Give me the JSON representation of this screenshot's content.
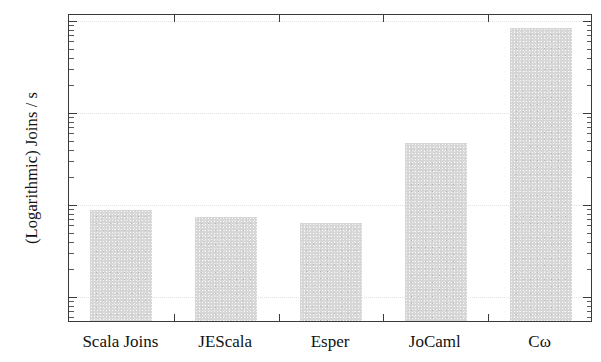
{
  "chart_data": {
    "type": "bar",
    "title": "",
    "xlabel": "",
    "ylabel": "(Logarithmic) Joins / s",
    "yscale": "log",
    "ylim": [
      5000,
      10000000
    ],
    "grid": true,
    "legend": null,
    "categories": [
      "Scala Joins",
      "JEScala",
      "Esper",
      "JoCaml",
      "Cω"
    ],
    "values": [
      85000,
      70000,
      60000,
      450000,
      8000000
    ],
    "ytick_labels": [
      "10⁷",
      "10⁶",
      "10⁵",
      "10⁴"
    ],
    "ytick_values": [
      10000000,
      1000000,
      100000,
      10000
    ],
    "bar_color": "#d6d6d6",
    "axis_color": "#3a3a3a",
    "grid_color": "#e2e2e2"
  },
  "axis": {
    "y_ticks": [
      {
        "mantissa": "10",
        "exponent": "7",
        "value": 10000000
      },
      {
        "mantissa": "10",
        "exponent": "6",
        "value": 1000000
      },
      {
        "mantissa": "10",
        "exponent": "5",
        "value": 100000
      },
      {
        "mantissa": "10",
        "exponent": "4",
        "value": 10000
      }
    ]
  }
}
